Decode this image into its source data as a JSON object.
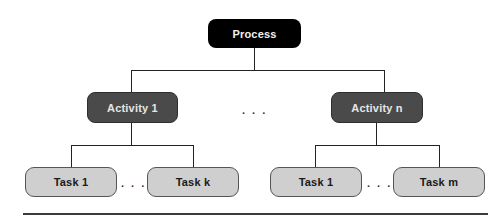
{
  "diagram": {
    "type": "hierarchy",
    "root": {
      "label": "Process"
    },
    "activities": [
      {
        "label": "Activity 1",
        "tasks": [
          {
            "label": "Task 1"
          },
          {
            "label": "Task k"
          }
        ],
        "task_separator": ". . ."
      },
      {
        "label": "Activity n",
        "tasks": [
          {
            "label": "Task 1"
          },
          {
            "label": "Task m"
          }
        ],
        "task_separator": ". . ."
      }
    ],
    "activity_separator": ". . .",
    "colors": {
      "process_fill": "#000000",
      "activity_fill": "#4a4a4a",
      "task_fill": "#cfcfcf",
      "connector": "#222222"
    }
  }
}
